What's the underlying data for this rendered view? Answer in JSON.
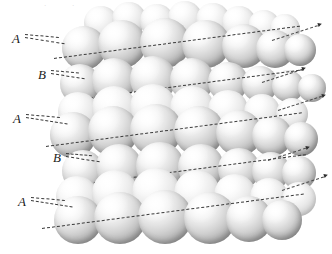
{
  "figure": {
    "name": "hexagonal-close-packed-stacking-diagram",
    "type": "diagram",
    "background_color": "#ffffff",
    "sphere_color": "#e8e8e8",
    "guide_line_color": "#3a3a3a",
    "label_color": "#1a1a1a"
  },
  "labels": [
    {
      "id": "layer-a-top",
      "text": "A",
      "x": 12,
      "y": 32
    },
    {
      "id": "layer-b-upper",
      "text": "B",
      "x": 38,
      "y": 68
    },
    {
      "id": "layer-a-middle",
      "text": "A",
      "x": 13,
      "y": 112
    },
    {
      "id": "layer-b-lower",
      "text": "B",
      "x": 53,
      "y": 151
    },
    {
      "id": "layer-a-bottom",
      "text": "A",
      "x": 18,
      "y": 195
    }
  ],
  "stacking_sequence": [
    "A",
    "B",
    "A",
    "B",
    "A"
  ],
  "layer_count": 5,
  "faint_marks": [
    {
      "text": "·",
      "x": 44,
      "y": 2
    },
    {
      "text": "·",
      "x": 72,
      "y": 2
    }
  ],
  "spheres": {
    "layer_a_top_back": [
      {
        "x": 84,
        "y": 6,
        "d": 34
      },
      {
        "x": 112,
        "y": 2,
        "d": 34
      },
      {
        "x": 140,
        "y": 4,
        "d": 34
      },
      {
        "x": 168,
        "y": 1,
        "d": 34
      },
      {
        "x": 196,
        "y": 3,
        "d": 34
      },
      {
        "x": 222,
        "y": 6,
        "d": 34
      },
      {
        "x": 248,
        "y": 10,
        "d": 32
      },
      {
        "x": 270,
        "y": 14,
        "d": 30
      }
    ],
    "layer_a_top_front": [
      {
        "x": 62,
        "y": 26,
        "d": 44
      },
      {
        "x": 98,
        "y": 20,
        "d": 48
      },
      {
        "x": 140,
        "y": 18,
        "d": 50
      },
      {
        "x": 182,
        "y": 20,
        "d": 48
      },
      {
        "x": 222,
        "y": 24,
        "d": 44
      },
      {
        "x": 256,
        "y": 30,
        "d": 38
      },
      {
        "x": 284,
        "y": 34,
        "d": 32
      }
    ],
    "layer_b_upper": [
      {
        "x": 60,
        "y": 64,
        "d": 40
      },
      {
        "x": 92,
        "y": 58,
        "d": 44
      },
      {
        "x": 130,
        "y": 56,
        "d": 46
      },
      {
        "x": 170,
        "y": 58,
        "d": 44
      },
      {
        "x": 208,
        "y": 62,
        "d": 40
      },
      {
        "x": 242,
        "y": 66,
        "d": 36
      },
      {
        "x": 272,
        "y": 70,
        "d": 32
      },
      {
        "x": 298,
        "y": 74,
        "d": 28
      }
    ],
    "layer_a_middle_back": [
      {
        "x": 58,
        "y": 92,
        "d": 40
      },
      {
        "x": 92,
        "y": 86,
        "d": 44
      },
      {
        "x": 130,
        "y": 84,
        "d": 46
      },
      {
        "x": 170,
        "y": 86,
        "d": 44
      },
      {
        "x": 208,
        "y": 90,
        "d": 40
      },
      {
        "x": 244,
        "y": 94,
        "d": 36
      },
      {
        "x": 276,
        "y": 98,
        "d": 32
      }
    ],
    "layer_a_middle_front": [
      {
        "x": 50,
        "y": 112,
        "d": 46
      },
      {
        "x": 88,
        "y": 106,
        "d": 50
      },
      {
        "x": 130,
        "y": 104,
        "d": 52
      },
      {
        "x": 174,
        "y": 106,
        "d": 50
      },
      {
        "x": 216,
        "y": 110,
        "d": 46
      },
      {
        "x": 252,
        "y": 116,
        "d": 40
      },
      {
        "x": 284,
        "y": 122,
        "d": 34
      }
    ],
    "layer_b_lower": [
      {
        "x": 62,
        "y": 150,
        "d": 42
      },
      {
        "x": 96,
        "y": 144,
        "d": 46
      },
      {
        "x": 136,
        "y": 142,
        "d": 48
      },
      {
        "x": 178,
        "y": 144,
        "d": 46
      },
      {
        "x": 218,
        "y": 148,
        "d": 42
      },
      {
        "x": 252,
        "y": 152,
        "d": 38
      },
      {
        "x": 282,
        "y": 156,
        "d": 34
      }
    ],
    "layer_a_bottom_back": [
      {
        "x": 56,
        "y": 176,
        "d": 42
      },
      {
        "x": 92,
        "y": 170,
        "d": 46
      },
      {
        "x": 132,
        "y": 168,
        "d": 48
      },
      {
        "x": 174,
        "y": 170,
        "d": 46
      },
      {
        "x": 214,
        "y": 174,
        "d": 42
      },
      {
        "x": 250,
        "y": 178,
        "d": 38
      },
      {
        "x": 282,
        "y": 182,
        "d": 34
      }
    ],
    "layer_a_bottom_front": [
      {
        "x": 54,
        "y": 196,
        "d": 48
      },
      {
        "x": 94,
        "y": 192,
        "d": 52
      },
      {
        "x": 138,
        "y": 190,
        "d": 54
      },
      {
        "x": 184,
        "y": 192,
        "d": 52
      },
      {
        "x": 226,
        "y": 196,
        "d": 46
      },
      {
        "x": 262,
        "y": 200,
        "d": 40
      }
    ]
  },
  "planes": [
    {
      "id": "plane-a-top",
      "x": 54,
      "y": 58,
      "w": 248,
      "angle": -7.5
    },
    {
      "id": "plane-b-upper",
      "x": 70,
      "y": 100,
      "w": 236,
      "angle": -7.5
    },
    {
      "id": "plane-a-middle",
      "x": 46,
      "y": 146,
      "w": 258,
      "angle": -7.5
    },
    {
      "id": "plane-b-lower",
      "x": 64,
      "y": 186,
      "w": 244,
      "angle": -7.5
    },
    {
      "id": "plane-a-bottom",
      "x": 42,
      "y": 228,
      "w": 264,
      "angle": -7.5
    }
  ],
  "exit_segments": [
    {
      "id": "exit-a-top",
      "x": 272,
      "y": 40,
      "w": 48,
      "angle": -18
    },
    {
      "id": "exit-b-upper",
      "x": 262,
      "y": 82,
      "w": 42,
      "angle": -18
    },
    {
      "id": "exit-a-middle",
      "x": 278,
      "y": 110,
      "w": 46,
      "angle": -18
    },
    {
      "id": "exit-b-lower",
      "x": 268,
      "y": 160,
      "w": 40,
      "angle": -18
    },
    {
      "id": "exit-a-bottom",
      "x": 282,
      "y": 190,
      "w": 44,
      "angle": -18
    }
  ],
  "leaders": [
    {
      "id": "leader-a-top",
      "x": 25,
      "y": 37,
      "w": 40,
      "angle": 9
    },
    {
      "id": "leader-a-top-2",
      "x": 25,
      "y": 34,
      "w": 34,
      "angle": 5
    },
    {
      "id": "leader-b-upper",
      "x": 51,
      "y": 73,
      "w": 34,
      "angle": 9
    },
    {
      "id": "leader-b-upper-2",
      "x": 51,
      "y": 70,
      "w": 28,
      "angle": 5
    },
    {
      "id": "leader-a-middle",
      "x": 26,
      "y": 117,
      "w": 42,
      "angle": 9
    },
    {
      "id": "leader-a-middle-2",
      "x": 26,
      "y": 114,
      "w": 34,
      "angle": 5
    },
    {
      "id": "leader-b-lower",
      "x": 66,
      "y": 156,
      "w": 34,
      "angle": 9
    },
    {
      "id": "leader-b-lower-2",
      "x": 66,
      "y": 153,
      "w": 26,
      "angle": 5
    },
    {
      "id": "leader-a-bottom",
      "x": 31,
      "y": 200,
      "w": 42,
      "angle": 9
    },
    {
      "id": "leader-a-bottom-2",
      "x": 31,
      "y": 197,
      "w": 34,
      "angle": 5
    }
  ]
}
